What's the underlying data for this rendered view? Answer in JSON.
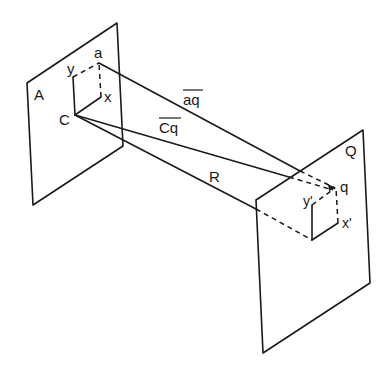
{
  "diagram": {
    "planes": [
      {
        "id": "A",
        "label": "A"
      },
      {
        "id": "Q",
        "label": "Q"
      }
    ],
    "plane_A": {
      "points": {
        "a": "a",
        "C": "C",
        "x": "x",
        "y": "y"
      }
    },
    "plane_Q": {
      "points": {
        "q": "q",
        "x_prime": "x'",
        "y_prime": "y'"
      }
    },
    "rays": [
      {
        "id": "aq",
        "label": "aq",
        "overline": true
      },
      {
        "id": "Cq",
        "label": "Cq",
        "overline": true
      },
      {
        "id": "R",
        "label": "R",
        "overline": false
      }
    ],
    "colors": {
      "stroke": "#1a1a1a",
      "background": "#ffffff"
    }
  }
}
